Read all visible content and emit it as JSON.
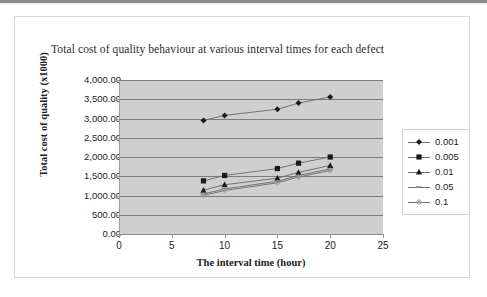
{
  "chart_data": {
    "type": "line",
    "title": "Total cost of quality behaviour at various interval times for each defect",
    "xlabel": "The interval time (hour)",
    "ylabel": "Total cost of quality (x1000)",
    "x": [
      8,
      10,
      15,
      17,
      20
    ],
    "xlim": [
      0,
      25
    ],
    "ylim": [
      0,
      4000
    ],
    "xticks": [
      "0",
      "5",
      "10",
      "15",
      "20",
      "25"
    ],
    "yticks": [
      "0.00",
      "500.00",
      "1,000.00",
      "1,500.00",
      "2,000.00",
      "2,500.00",
      "3,000.00",
      "3,500.00",
      "4,000.00"
    ],
    "grid": true,
    "legend_position": "right",
    "plot_background": "#cfcfcf",
    "series": [
      {
        "name": "0.001",
        "marker": "diamond",
        "color": "#1a1a1a",
        "values": [
          2950,
          3080,
          3240,
          3400,
          3560
        ]
      },
      {
        "name": "0.005",
        "marker": "square",
        "color": "#1a1a1a",
        "values": [
          1380,
          1520,
          1700,
          1840,
          2000
        ]
      },
      {
        "name": "0.01",
        "marker": "triangle",
        "color": "#1a1a1a",
        "values": [
          1140,
          1280,
          1450,
          1600,
          1780
        ]
      },
      {
        "name": "0.05",
        "marker": "dash",
        "color": "#8a8a8a",
        "values": [
          1040,
          1170,
          1370,
          1520,
          1690
        ]
      },
      {
        "name": "0.1",
        "marker": "star",
        "color": "#9a9a9a",
        "values": [
          1000,
          1130,
          1330,
          1480,
          1650
        ]
      }
    ]
  },
  "legend": {
    "items": [
      {
        "label": "0.001"
      },
      {
        "label": "0.005"
      },
      {
        "label": "0.01"
      },
      {
        "label": "0.05"
      },
      {
        "label": "0.1"
      }
    ]
  }
}
